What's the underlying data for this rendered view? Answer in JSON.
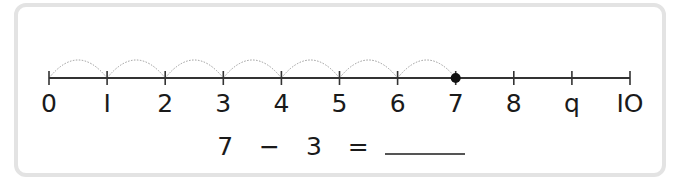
{
  "number_line": {
    "min": 0,
    "max": 10,
    "labels": [
      "0",
      "I",
      "2",
      "3",
      "4",
      "5",
      "6",
      "7",
      "8",
      "q",
      "IO"
    ],
    "marked_point": 7,
    "hops": [
      {
        "from": 0,
        "to": 1
      },
      {
        "from": 1,
        "to": 2
      },
      {
        "from": 2,
        "to": 3
      },
      {
        "from": 3,
        "to": 4
      },
      {
        "from": 4,
        "to": 5
      },
      {
        "from": 5,
        "to": 6
      },
      {
        "from": 6,
        "to": 7
      }
    ],
    "colors": {
      "line": "#333333",
      "hop": "#9a9a9a",
      "point": "#111111",
      "frame": "#e3e3e3"
    }
  },
  "equation": {
    "left": "7",
    "operator": "−",
    "right": "3",
    "equals": "=",
    "answer": ""
  }
}
